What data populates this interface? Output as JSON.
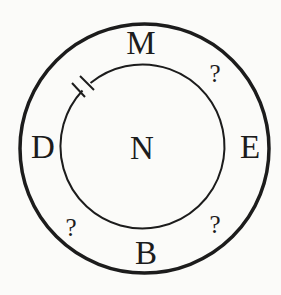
{
  "diagram": {
    "center_label": "N",
    "outer_labels": {
      "top": "M",
      "left": "D",
      "right": "E",
      "bottom": "B",
      "top_right": "?",
      "bottom_left": "?",
      "bottom_right": "?"
    },
    "colors": {
      "ink": "#1c1c1c",
      "background": "#fbfbf9"
    },
    "shapes": {
      "outer_circle": {
        "cx": 144.5,
        "cy": 148.5,
        "r": 124.5,
        "stroke_width": 3.5
      },
      "inner_circle": {
        "cx": 142,
        "cy": 147,
        "r": 82,
        "stroke_width": 2
      },
      "double_tick_mark": {
        "position": "upper-left of inner circle",
        "count": 2
      }
    }
  }
}
